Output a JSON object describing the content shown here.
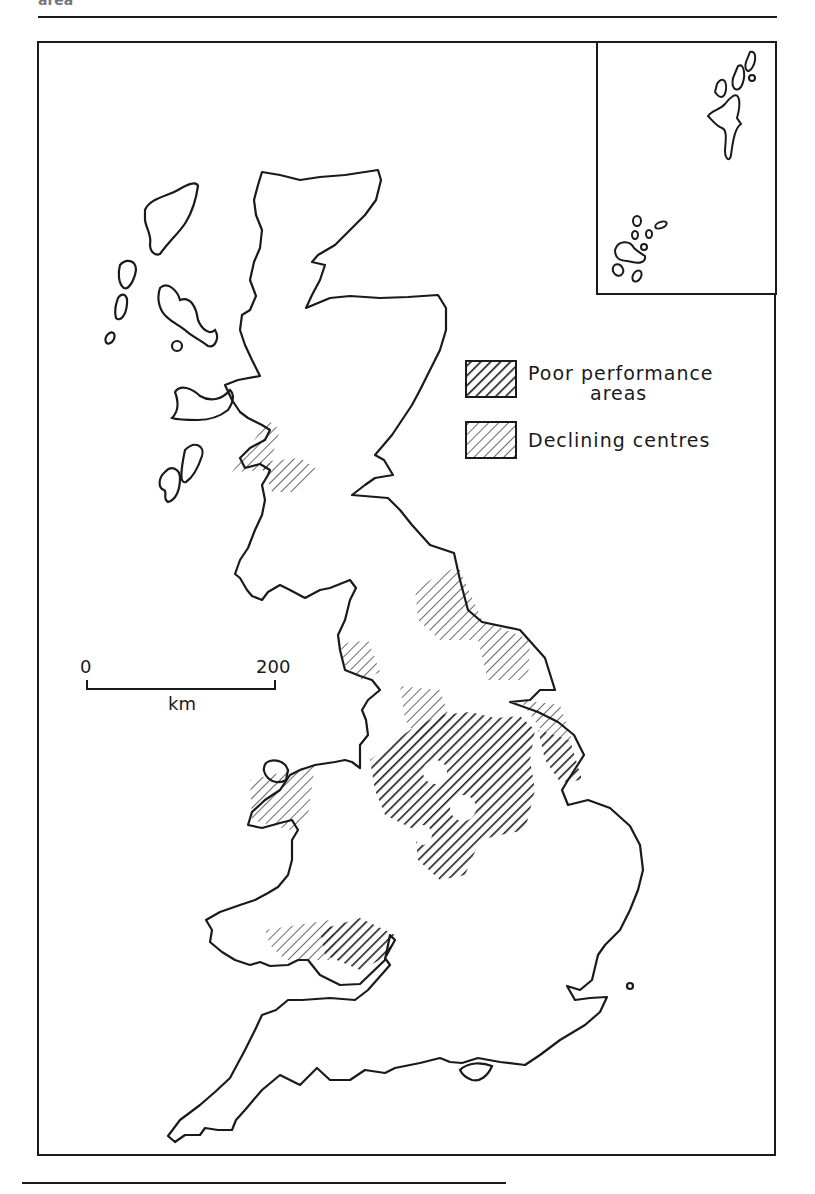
{
  "figure": {
    "header_fragment": "area",
    "colors": {
      "ink": "#1a1a1a",
      "paper": "#ffffff"
    }
  },
  "legend": {
    "items": [
      {
        "label_line1": "Poor performance",
        "label_line2": "areas",
        "pattern": "dense-diagonal-hatch"
      },
      {
        "label_line1": "Declining centres",
        "label_line2": "",
        "pattern": "light-diagonal-hatch"
      }
    ]
  },
  "scale_bar": {
    "start_label": "0",
    "end_label": "200",
    "unit_label": "km"
  },
  "inset": {
    "content": "Orkney and Shetland islands"
  },
  "regions": {
    "poor_performance": [
      "West Midlands / East Midlands / Yorkshire conurbations",
      "South Wales (east)"
    ],
    "declining_centres": [
      "Central Clydeside",
      "North-East England",
      "Merseyside / Lancashire",
      "North Wales coast",
      "South Wales (west)",
      "Humberside"
    ]
  }
}
